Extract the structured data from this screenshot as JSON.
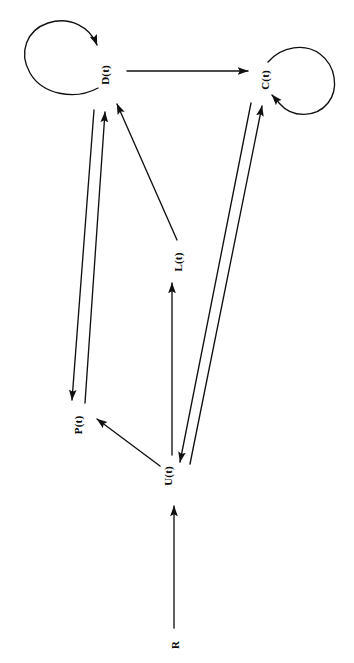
{
  "diagram": {
    "type": "signal-flow-block-diagram",
    "orientation_note": "all labels rendered rotated 90 degrees counter-clockwise",
    "background_color": "#ffffff",
    "stroke_color": "#101010",
    "nodes": [
      {
        "id": "D",
        "label": "D(t)",
        "x": 105,
        "y": 75,
        "has_self_loop": true,
        "self_loop_side": "left"
      },
      {
        "id": "C",
        "label": "C(t)",
        "x": 265,
        "y": 80,
        "has_self_loop": true,
        "self_loop_side": "right"
      },
      {
        "id": "P",
        "label": "P(t)",
        "x": 78,
        "y": 425,
        "has_self_loop": false,
        "self_loop_side": ""
      },
      {
        "id": "U",
        "label": "U(t)",
        "x": 168,
        "y": 476,
        "has_self_loop": false,
        "self_loop_side": ""
      },
      {
        "id": "R",
        "label": "R",
        "x": 175,
        "y": 645,
        "has_self_loop": false,
        "self_loop_side": ""
      }
    ],
    "edge_labels": [
      {
        "id": "L",
        "label": "L(t)",
        "x": 178,
        "y": 262
      }
    ],
    "edges": [
      {
        "from": "D",
        "to": "D",
        "kind": "self-loop",
        "label": ""
      },
      {
        "from": "C",
        "to": "C",
        "kind": "self-loop",
        "label": ""
      },
      {
        "from": "D",
        "to": "C",
        "kind": "straight-arrow",
        "label": ""
      },
      {
        "from": "D",
        "to": "P",
        "kind": "straight-arrow",
        "label": ""
      },
      {
        "from": "P",
        "to": "D",
        "kind": "straight-arrow",
        "label": ""
      },
      {
        "from": "U",
        "to": "P",
        "kind": "straight-arrow",
        "label": ""
      },
      {
        "from": "U",
        "to": "D",
        "kind": "straight-arrow",
        "label": "L(t)"
      },
      {
        "from": "U",
        "to": "C",
        "kind": "straight-arrow",
        "label": ""
      },
      {
        "from": "C",
        "to": "U",
        "kind": "straight-arrow",
        "label": ""
      },
      {
        "from": "R",
        "to": "U",
        "kind": "straight-arrow",
        "label": ""
      }
    ]
  }
}
